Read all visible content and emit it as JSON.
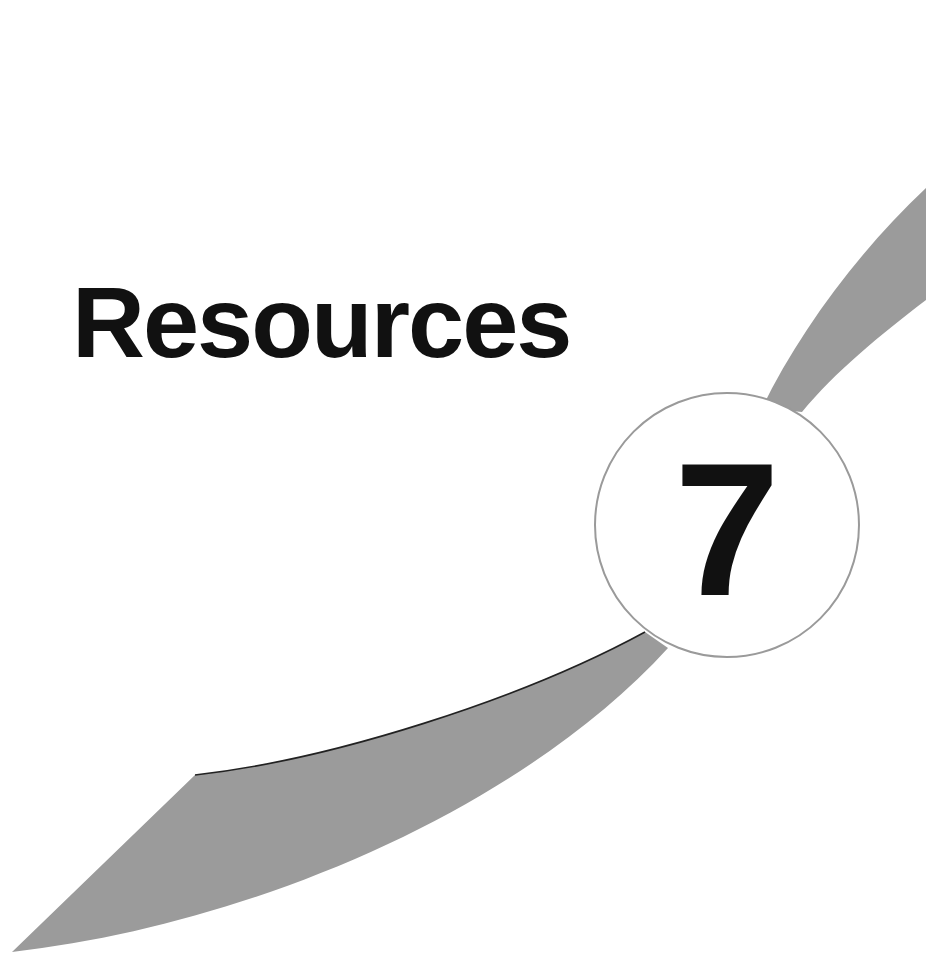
{
  "chapter": {
    "title": "Resources",
    "number": "7"
  },
  "colors": {
    "background": "#ffffff",
    "swoosh": "#9b9b9b",
    "text": "#111111",
    "badge_border": "#9a9a9a"
  }
}
